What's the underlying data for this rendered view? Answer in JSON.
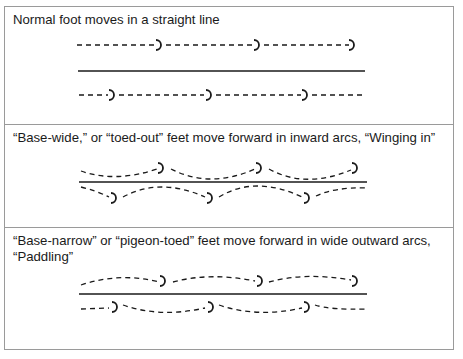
{
  "figure": {
    "panels": [
      {
        "id": "normal",
        "caption": "Normal foot moves in a straight line",
        "gait": "straight"
      },
      {
        "id": "base-wide",
        "caption": "“Base-wide,” or “toed-out” feet move forward in inward arcs, “Winging in”",
        "gait": "winging-in"
      },
      {
        "id": "base-narrow",
        "caption": "“Base-narrow” or “pigeon-toed” feet move forward in wide outward arcs, “Paddling”",
        "gait": "paddling"
      }
    ],
    "hoofprints_per_track": 3,
    "line_color": "#1a1a1a",
    "border_color": "#9a9a9a"
  }
}
